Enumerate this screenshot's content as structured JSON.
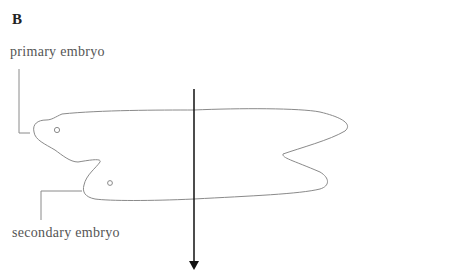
{
  "figure": {
    "panel_label": "B",
    "labels": {
      "primary": "primary embryo",
      "secondary": "secondary embryo"
    },
    "colors": {
      "outline": "#8a8a8a",
      "arrow": "#111111",
      "text": "#555555"
    }
  }
}
